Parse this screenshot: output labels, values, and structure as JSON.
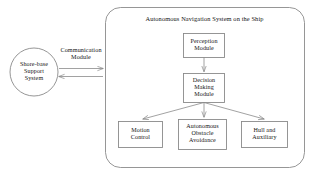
{
  "diagram": {
    "title": "Autonomous Navigation System on the Ship",
    "shore_node": {
      "name": "Shore-base Support System",
      "lines": [
        "Shore-base",
        "Support",
        "System"
      ]
    },
    "connection": {
      "label_lines": [
        "Communication",
        "Module"
      ],
      "label": "Communication Module",
      "direction": "bidirectional"
    },
    "nodes": [
      {
        "id": "perception",
        "lines": [
          "Perception",
          "Module"
        ],
        "label": "Perception Module"
      },
      {
        "id": "decision",
        "lines": [
          "Decision",
          "Making",
          "Module"
        ],
        "label": "Decision Making Module"
      },
      {
        "id": "motion",
        "lines": [
          "Motion",
          "Control"
        ],
        "label": "Motion Control"
      },
      {
        "id": "obstacle",
        "lines": [
          "Autonomous",
          "Obstacle",
          "Avoidance"
        ],
        "label": "Autonomous Obstacle Avoidance"
      },
      {
        "id": "hull",
        "lines": [
          "Hull and",
          "Auxiliary"
        ],
        "label": "Hull and Auxiliary"
      }
    ],
    "colors": {
      "stroke": "#8a8a8a",
      "text": "#141414",
      "background": "#ffffff"
    }
  }
}
